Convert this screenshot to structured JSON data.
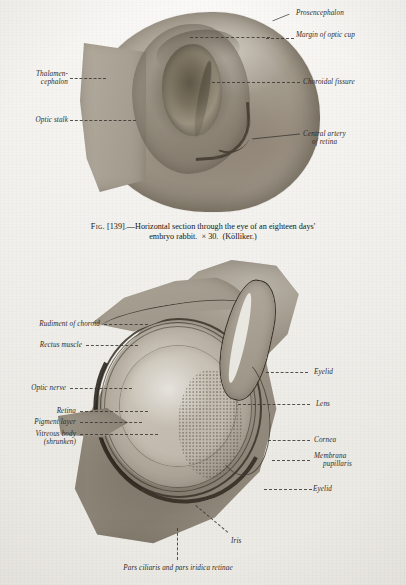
{
  "page": {
    "kind": "anatomy-plate",
    "paper_color": "#f2f1ee",
    "ink_color": "#2e2c29"
  },
  "figure1": {
    "name": "embryo-rabbit-eye-horizontal-section",
    "labels": [
      {
        "id": "prosencephalon",
        "text": "Prosencephalon"
      },
      {
        "id": "margin-optic-cup",
        "text": "Margin of optic cup"
      },
      {
        "id": "thalamencephalon",
        "line1": "Thalamen-",
        "line2": "cephalon"
      },
      {
        "id": "optic-stalk",
        "text": "Optic stalk"
      },
      {
        "id": "choroidal-fissure",
        "text": "Choroidal fissure"
      },
      {
        "id": "central-artery",
        "line1": "Central artery",
        "line2": "of retina"
      }
    ]
  },
  "caption": {
    "fig_word": "Fig.",
    "number": "[139].",
    "dash": "—",
    "line1": "Horizontal section through the eye of an eighteen days'",
    "line2_a": "embryo rabbit.",
    "magnification": "× 30.",
    "source": "(Kölliker.)"
  },
  "figure2": {
    "name": "eye-sagittal-section-with-eyelids",
    "labels": [
      {
        "id": "rudiment-of-choroid",
        "text": "Rudiment of choroid"
      },
      {
        "id": "rectus-muscle",
        "text": "Rectus muscle"
      },
      {
        "id": "optic-nerve",
        "text": "Optic nerve"
      },
      {
        "id": "retina",
        "text": "Retina"
      },
      {
        "id": "pigment-layer",
        "text": "Pigment layer"
      },
      {
        "id": "vitreous-body",
        "line1": "Vitreous body",
        "line2": "(shrunken)"
      },
      {
        "id": "eyelid-upper",
        "text": "Eyelid"
      },
      {
        "id": "lens",
        "text": "Lens"
      },
      {
        "id": "cornea",
        "text": "Cornea"
      },
      {
        "id": "membrana-pupillaris",
        "line1": "Membrana",
        "line2": "pupillaris"
      },
      {
        "id": "eyelid-lower",
        "text": "Eyelid"
      },
      {
        "id": "iris",
        "text": "Iris"
      },
      {
        "id": "pars-ciliaris",
        "text": "Pars ciliaris and pars iridica retinae"
      }
    ]
  }
}
